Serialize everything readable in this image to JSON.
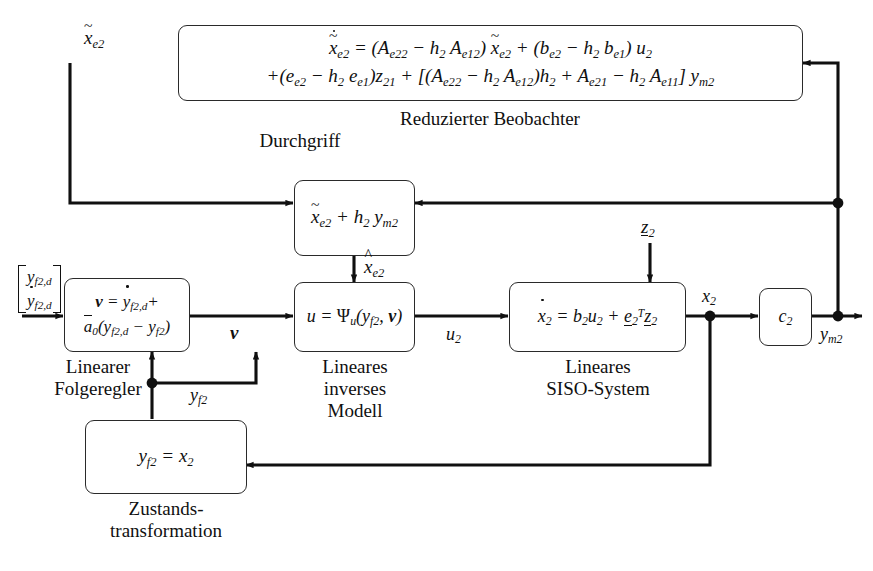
{
  "diagram": {
    "language": "de",
    "line_color": "#101010"
  },
  "blocks": {
    "observer": {
      "name": "reduzierter-beobachter",
      "equation_line1": "ẋ̃e2 = (Ae22 − h2 Ae12) x̃e2 + (be2 − h2 be1) u2",
      "equation_line2": "+(ee2 − h2 ee1)z21 + [(Ae22 − h2 Ae12)h2 + Ae21 − h2 Ae11] ym2",
      "caption": "Reduzierter Beobachter"
    },
    "durchgriff": {
      "name": "durchgriff",
      "equation": "x̃e2 + h2 ym2",
      "caption": "Durchgriff"
    },
    "controller": {
      "name": "linearer-folgeregler",
      "equation_line1": "ν = ẏf2,d +",
      "equation_line2": "ā0(yf2,d − yf2)",
      "caption": "Linearer\nFolgeregler"
    },
    "inverse_model": {
      "name": "lineares-inverses-modell",
      "equation": "u = Ψu(yf2, ν)",
      "caption": "Lineares\ninverses\nModell"
    },
    "siso": {
      "name": "lineares-siso-system",
      "equation": "ẋ2 = b2u2 + e2T z2",
      "caption": "Lineares\nSISO-System"
    },
    "output_gain": {
      "name": "ausgangsmatrix",
      "equation": "c2"
    },
    "state_transform": {
      "name": "zustandstransformation",
      "equation": "yf2 = x2",
      "caption": "Zustands-\ntransformation"
    }
  },
  "signals": {
    "x_tilde_e2": "x̃e2",
    "x_hat_e2": "x̂e2",
    "nu": "ν",
    "u2": "u2",
    "z2": "z2",
    "x2": "x2",
    "ym2": "ym2",
    "yf2": "yf2",
    "reference_top": "yf2,d",
    "reference_bottom": "ẏf2,d"
  }
}
